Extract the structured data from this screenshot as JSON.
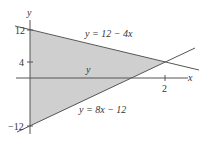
{
  "figure": {
    "axes": {
      "x_label": "x",
      "y_label": "y",
      "x_ticks": [
        {
          "value": 2,
          "label": "2"
        }
      ],
      "y_ticks": [
        {
          "value": 12,
          "label": "12"
        },
        {
          "value": 4,
          "label": "4"
        },
        {
          "value": -12,
          "label": "−12"
        }
      ]
    },
    "curves": [
      {
        "name": "upper-line",
        "equation": "y = 12 − 4x",
        "label": "y = 12 − 4x"
      },
      {
        "name": "lower-line",
        "equation": "y = 8x − 12",
        "label": "y = 8x − 12"
      }
    ],
    "region_label": "y",
    "shaded_region": {
      "vertices": [
        [
          0,
          12
        ],
        [
          2,
          4
        ],
        [
          0,
          -12
        ]
      ]
    },
    "colors": {
      "fill": "#cfcfcf",
      "line": "#555555",
      "axis": "#555555"
    }
  }
}
